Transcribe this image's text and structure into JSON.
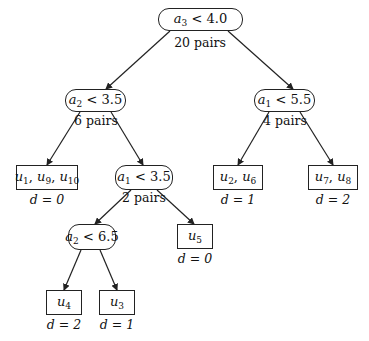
{
  "diagram": {
    "type": "decision-tree",
    "nodes": [
      {
        "id": "root",
        "kind": "decision",
        "var": "a",
        "sub": "3",
        "op": "<",
        "value": "4.0",
        "pairs": "20 pairs",
        "box": [
          158,
          8,
          85,
          23
        ]
      },
      {
        "id": "left",
        "kind": "decision",
        "var": "a",
        "sub": "2",
        "op": "<",
        "value": "3.5",
        "pairs": "6 pairs",
        "box": [
          65,
          89,
          61,
          23
        ]
      },
      {
        "id": "right",
        "kind": "decision",
        "var": "a",
        "sub": "1",
        "op": "<",
        "value": "5.5",
        "pairs": "4 pairs",
        "box": [
          254,
          89,
          61,
          23
        ]
      },
      {
        "id": "left-right",
        "kind": "decision",
        "var": "a",
        "sub": "1",
        "op": "<",
        "value": "3.5",
        "pairs": "2 pairs",
        "box": [
          115,
          165,
          58,
          25
        ]
      },
      {
        "id": "left-right-left",
        "kind": "decision",
        "var": "a",
        "sub": "2",
        "op": "<",
        "value": "6.5",
        "pairs": "",
        "box": [
          68,
          224,
          48,
          26
        ]
      },
      {
        "id": "leaf-u1-u9-u10",
        "kind": "leaf",
        "items": [
          [
            "u",
            "1"
          ],
          [
            "u",
            "9"
          ],
          [
            "u",
            "10"
          ]
        ],
        "d": "d = 0",
        "box": [
          16,
          165,
          62,
          25
        ]
      },
      {
        "id": "leaf-u2-u6",
        "kind": "leaf",
        "items": [
          [
            "u",
            "2"
          ],
          [
            "u",
            "6"
          ]
        ],
        "d": "d = 1",
        "box": [
          213,
          165,
          50,
          25
        ]
      },
      {
        "id": "leaf-u7-u8",
        "kind": "leaf",
        "items": [
          [
            "u",
            "7"
          ],
          [
            "u",
            "8"
          ]
        ],
        "d": "d = 2",
        "box": [
          308,
          165,
          50,
          25
        ]
      },
      {
        "id": "leaf-u5",
        "kind": "leaf",
        "items": [
          [
            "u",
            "5"
          ]
        ],
        "d": "d = 0",
        "box": [
          177,
          224,
          36,
          25
        ]
      },
      {
        "id": "leaf-u4",
        "kind": "leaf",
        "items": [
          [
            "u",
            "4"
          ]
        ],
        "d": "d = 2",
        "box": [
          46,
          290,
          36,
          25
        ]
      },
      {
        "id": "leaf-u3",
        "kind": "leaf",
        "items": [
          [
            "u",
            "3"
          ]
        ],
        "d": "d = 1",
        "box": [
          99,
          290,
          36,
          25
        ]
      }
    ],
    "edges": [
      {
        "from": "root",
        "to": "left",
        "line": [
          170,
          31,
          106,
          89
        ]
      },
      {
        "from": "root",
        "to": "right",
        "line": [
          228,
          31,
          293,
          89
        ]
      },
      {
        "from": "left",
        "to": "leaf-u1-u9-u10",
        "line": [
          80,
          112,
          47,
          165
        ]
      },
      {
        "from": "left",
        "to": "left-right",
        "line": [
          111,
          112,
          143,
          165
        ]
      },
      {
        "from": "right",
        "to": "leaf-u2-u6",
        "line": [
          269,
          112,
          238,
          165
        ]
      },
      {
        "from": "right",
        "to": "leaf-u7-u8",
        "line": [
          300,
          112,
          333,
          165
        ]
      },
      {
        "from": "left-right",
        "to": "left-right-left",
        "line": [
          131,
          190,
          95,
          224
        ]
      },
      {
        "from": "left-right",
        "to": "leaf-u5",
        "line": [
          157,
          190,
          194,
          224
        ]
      },
      {
        "from": "left-right-left",
        "to": "leaf-u4",
        "line": [
          81,
          250,
          64,
          290
        ]
      },
      {
        "from": "left-right-left",
        "to": "leaf-u3",
        "line": [
          100,
          250,
          117,
          290
        ]
      }
    ],
    "captions": {
      "root_pairs": "20 pairs",
      "left_pairs": "6 pairs",
      "right_pairs": "4 pairs",
      "left_right_pairs": "2 pairs",
      "leaf_u1_u9_u10_d": "d = 0",
      "leaf_u2_u6_d": "d = 1",
      "leaf_u7_u8_d": "d = 2",
      "leaf_u5_d": "d = 0",
      "leaf_u4_d": "d = 2",
      "leaf_u3_d": "d = 1"
    },
    "colors": {
      "stroke": "#222222",
      "text": "#111111",
      "background": "#ffffff"
    }
  }
}
